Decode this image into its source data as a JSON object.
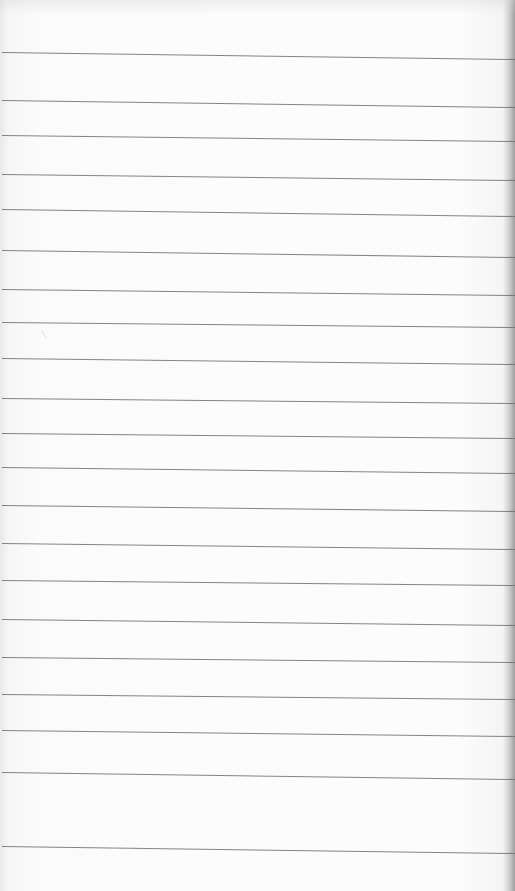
{
  "image": {
    "subject": "blank ruled notebook paper",
    "width": 515,
    "height": 891
  },
  "colors": {
    "paper": "#fbfbfb",
    "rule_line": "#6e6e6e",
    "right_edge_shadow": "#9e9e9e"
  },
  "ruled_lines": [
    {
      "y_left": 52,
      "y_right": 59
    },
    {
      "y_left": 100,
      "y_right": 107
    },
    {
      "y_left": 135,
      "y_right": 141
    },
    {
      "y_left": 174,
      "y_right": 180
    },
    {
      "y_left": 209,
      "y_right": 216
    },
    {
      "y_left": 250,
      "y_right": 257
    },
    {
      "y_left": 289,
      "y_right": 295
    },
    {
      "y_left": 322,
      "y_right": 327
    },
    {
      "y_left": 358,
      "y_right": 364
    },
    {
      "y_left": 398,
      "y_right": 403
    },
    {
      "y_left": 433,
      "y_right": 438
    },
    {
      "y_left": 467,
      "y_right": 473
    },
    {
      "y_left": 505,
      "y_right": 511
    },
    {
      "y_left": 543,
      "y_right": 549
    },
    {
      "y_left": 580,
      "y_right": 585
    },
    {
      "y_left": 619,
      "y_right": 625
    },
    {
      "y_left": 657,
      "y_right": 662
    },
    {
      "y_left": 694,
      "y_right": 699
    },
    {
      "y_left": 730,
      "y_right": 736
    },
    {
      "y_left": 772,
      "y_right": 779
    },
    {
      "y_left": 846,
      "y_right": 853
    }
  ]
}
